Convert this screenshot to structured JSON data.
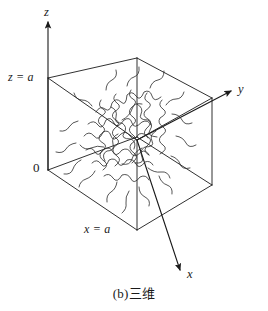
{
  "figure": {
    "caption": "(b)三维",
    "labels": {
      "z_axis": "z",
      "y_axis": "y",
      "x_axis": "x",
      "z_equals_a": "z = a",
      "x_equals_a": "x = a",
      "origin": "0"
    },
    "colors": {
      "line": "#1a1a1a",
      "background": "#ffffff",
      "coil": "#2a2a2a"
    },
    "icons": {
      "z_arrow": "arrow-up-icon",
      "y_arrow": "arrow-right-icon",
      "x_arrow": "arrow-down-right-icon"
    },
    "geometry": {
      "cube_vertices": {
        "left_top": [
          48,
          78
        ],
        "left_bottom": [
          48,
          170
        ],
        "back_top": [
          137,
          58
        ],
        "back_bottom": [
          137,
          137
        ],
        "right_top": [
          212,
          98
        ],
        "right_bottom": [
          212,
          185
        ],
        "front_top": [
          137,
          140
        ],
        "front_bottom": [
          137,
          230
        ]
      },
      "z_axis_tip": [
        48,
        16
      ],
      "y_axis_tip": [
        234,
        90
      ],
      "x_axis_tip": [
        183,
        273
      ],
      "coil_center": [
        134,
        140
      ]
    }
  }
}
